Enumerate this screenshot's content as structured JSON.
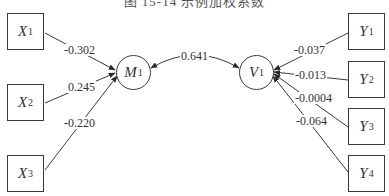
{
  "caption": "图 15-14  示例加权系数",
  "nodes": {
    "x1": {
      "var": "X",
      "sub": "1"
    },
    "x2": {
      "var": "X",
      "sub": "2"
    },
    "x3": {
      "var": "X",
      "sub": "3"
    },
    "m1": {
      "var": "M",
      "sub": "1"
    },
    "v1": {
      "var": "V",
      "sub": "1"
    },
    "y1": {
      "var": "Y",
      "sub": "1"
    },
    "y2": {
      "var": "Y",
      "sub": "2"
    },
    "y3": {
      "var": "Y",
      "sub": "3"
    },
    "y4": {
      "var": "Y",
      "sub": "4"
    }
  },
  "edges": {
    "x1_m1": "-0.302",
    "x2_m1": "0.245",
    "x3_m1": "-0.220",
    "m1_v1": "0.641",
    "y1_v1": "-0.037",
    "y2_v1": "-0.013",
    "y3_v1": "-0.0004",
    "y4_v1": "-0.064"
  },
  "colors": {
    "line": "#3a3a3a",
    "text": "#333333",
    "background": "#ffffff"
  }
}
